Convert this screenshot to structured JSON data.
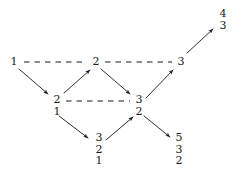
{
  "figure": {
    "type": "directed-graph-diagram",
    "width": 238,
    "height": 176,
    "background": "#ffffff",
    "ink": "#1a1a1a"
  },
  "nodes": [
    {
      "id": "n1",
      "labels": [
        "1"
      ],
      "x": 14,
      "y": 62,
      "name": "node-1"
    },
    {
      "id": "n2",
      "labels": [
        "2"
      ],
      "x": 96,
      "y": 62,
      "name": "node-2"
    },
    {
      "id": "n3",
      "labels": [
        "3"
      ],
      "x": 181,
      "y": 62,
      "name": "node-3"
    },
    {
      "id": "n21",
      "labels": [
        "2",
        "1"
      ],
      "x": 57,
      "y": 105,
      "name": "node-2-1"
    },
    {
      "id": "n32",
      "labels": [
        "3",
        "2"
      ],
      "x": 139,
      "y": 105,
      "name": "node-3-2"
    },
    {
      "id": "n321",
      "labels": [
        "3",
        "2",
        "1"
      ],
      "x": 99,
      "y": 149,
      "name": "node-3-2-1"
    },
    {
      "id": "n532",
      "labels": [
        "5",
        "3",
        "2"
      ],
      "x": 179,
      "y": 149,
      "name": "node-5-3-2"
    },
    {
      "id": "n43",
      "labels": [
        "4",
        "3"
      ],
      "x": 223,
      "y": 19,
      "name": "node-4-3"
    }
  ],
  "edges": [
    {
      "id": "e1",
      "from": "n1",
      "to": "n2",
      "style": "dashed",
      "x1": 24,
      "y1": 62,
      "x2": 87,
      "y2": 62,
      "name": "dashed-edge-1-to-2"
    },
    {
      "id": "e2",
      "from": "n2",
      "to": "n3",
      "style": "dashed",
      "x1": 105,
      "y1": 62,
      "x2": 172,
      "y2": 62,
      "name": "dashed-edge-2-to-3"
    },
    {
      "id": "e3",
      "from": "n21",
      "to": "n32",
      "style": "dashed",
      "x1": 66,
      "y1": 101,
      "x2": 130,
      "y2": 101,
      "name": "dashed-edge-21-to-32"
    },
    {
      "id": "e4",
      "from": "n1",
      "to": "n21",
      "style": "arrow",
      "x1": 19,
      "y1": 69,
      "x2": 48,
      "y2": 94,
      "name": "arrow-1-to-21"
    },
    {
      "id": "e5",
      "from": "n21",
      "to": "n2",
      "style": "arrow",
      "x1": 64,
      "y1": 93,
      "x2": 90,
      "y2": 70,
      "name": "arrow-21-to-2"
    },
    {
      "id": "e6",
      "from": "n2",
      "to": "n32",
      "style": "arrow",
      "x1": 101,
      "y1": 69,
      "x2": 130,
      "y2": 94,
      "name": "arrow-2-to-32"
    },
    {
      "id": "e7",
      "from": "n32",
      "to": "n3",
      "style": "arrow",
      "x1": 146,
      "y1": 98,
      "x2": 173,
      "y2": 70,
      "name": "arrow-32-to-3"
    },
    {
      "id": "e8",
      "from": "n21",
      "to": "n321",
      "style": "arrow",
      "x1": 59,
      "y1": 116,
      "x2": 88,
      "y2": 138,
      "name": "arrow-21-to-321"
    },
    {
      "id": "e9",
      "from": "n321",
      "to": "n32",
      "style": "arrow",
      "x1": 106,
      "y1": 140,
      "x2": 133,
      "y2": 117,
      "name": "arrow-321-to-32"
    },
    {
      "id": "e10",
      "from": "n32",
      "to": "n532",
      "style": "arrow",
      "x1": 144,
      "y1": 116,
      "x2": 170,
      "y2": 137,
      "name": "arrow-32-to-532"
    },
    {
      "id": "e11",
      "from": "n3",
      "to": "n43",
      "style": "arrow",
      "x1": 187,
      "y1": 53,
      "x2": 213,
      "y2": 29,
      "name": "arrow-3-to-43"
    }
  ]
}
